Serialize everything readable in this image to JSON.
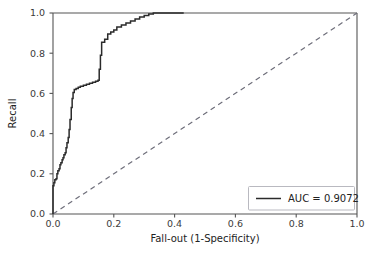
{
  "chart_data": {
    "type": "line",
    "title": "",
    "subtitle": "",
    "xlabel": "Fall-out (1-Specificity)",
    "ylabel": "Recall",
    "xlim": [
      0.0,
      1.0
    ],
    "ylim": [
      0.0,
      1.0
    ],
    "grid": false,
    "legend_position": "lower right",
    "xticks": [
      "0.0",
      "0.2",
      "0.4",
      "0.6",
      "0.8",
      "1.0"
    ],
    "xtick_values": [
      0.0,
      0.2,
      0.4,
      0.6,
      0.8,
      1.0
    ],
    "yticks": [
      "0.0",
      "0.2",
      "0.4",
      "0.6",
      "0.8",
      "1.0"
    ],
    "ytick_values": [
      0.0,
      0.2,
      0.4,
      0.6,
      0.8,
      1.0
    ],
    "annotations": [],
    "series": [
      {
        "name": "AUC = 0.9072",
        "style": "solid",
        "color": "#2b2b2b",
        "x": [
          0.0,
          0.0,
          0.003,
          0.003,
          0.006,
          0.006,
          0.01,
          0.01,
          0.013,
          0.013,
          0.016,
          0.016,
          0.02,
          0.02,
          0.023,
          0.023,
          0.026,
          0.026,
          0.03,
          0.03,
          0.033,
          0.033,
          0.036,
          0.036,
          0.04,
          0.04,
          0.043,
          0.043,
          0.046,
          0.046,
          0.05,
          0.05,
          0.053,
          0.053,
          0.056,
          0.056,
          0.06,
          0.06,
          0.063,
          0.063,
          0.066,
          0.066,
          0.07,
          0.07,
          0.076,
          0.076,
          0.083,
          0.083,
          0.09,
          0.09,
          0.1,
          0.1,
          0.11,
          0.11,
          0.12,
          0.12,
          0.13,
          0.13,
          0.14,
          0.14,
          0.148,
          0.148,
          0.152,
          0.152,
          0.156,
          0.156,
          0.16,
          0.16,
          0.17,
          0.17,
          0.18,
          0.18,
          0.19,
          0.19,
          0.2,
          0.2,
          0.21,
          0.21,
          0.225,
          0.225,
          0.24,
          0.24,
          0.255,
          0.255,
          0.27,
          0.27,
          0.285,
          0.285,
          0.3,
          0.3,
          0.315,
          0.315,
          0.33,
          0.33,
          0.43
        ],
        "y": [
          0.0,
          0.14,
          0.14,
          0.155,
          0.155,
          0.17,
          0.17,
          0.175,
          0.175,
          0.2,
          0.2,
          0.215,
          0.215,
          0.225,
          0.225,
          0.245,
          0.245,
          0.255,
          0.255,
          0.27,
          0.27,
          0.28,
          0.28,
          0.295,
          0.295,
          0.305,
          0.305,
          0.33,
          0.33,
          0.355,
          0.355,
          0.38,
          0.38,
          0.42,
          0.42,
          0.47,
          0.47,
          0.53,
          0.53,
          0.575,
          0.575,
          0.605,
          0.605,
          0.62,
          0.62,
          0.625,
          0.625,
          0.63,
          0.63,
          0.635,
          0.635,
          0.64,
          0.64,
          0.645,
          0.645,
          0.65,
          0.65,
          0.655,
          0.655,
          0.66,
          0.66,
          0.665,
          0.665,
          0.72,
          0.72,
          0.79,
          0.79,
          0.855,
          0.855,
          0.87,
          0.87,
          0.895,
          0.895,
          0.905,
          0.905,
          0.915,
          0.915,
          0.93,
          0.93,
          0.94,
          0.94,
          0.95,
          0.95,
          0.96,
          0.96,
          0.97,
          0.97,
          0.98,
          0.98,
          0.988,
          0.988,
          0.995,
          0.995,
          1.0,
          1.0
        ]
      },
      {
        "name": "chance-diagonal",
        "style": "dashed",
        "color": "#6e6e7a",
        "x": [
          0.0,
          1.0
        ],
        "y": [
          0.0,
          1.0
        ]
      }
    ],
    "legend": [
      {
        "label": "AUC = 0.9072",
        "color": "#2b2b2b",
        "style": "solid"
      }
    ],
    "auc_value": "0.9072"
  },
  "axes": {
    "xlabel": "Fall-out (1-Specificity)",
    "ylabel": "Recall",
    "xtick_labels": [
      "0.0",
      "0.2",
      "0.4",
      "0.6",
      "0.8",
      "1.0"
    ],
    "ytick_labels": [
      "0.0",
      "0.2",
      "0.4",
      "0.6",
      "0.8",
      "1.0"
    ]
  },
  "legend": {
    "auc_label": "AUC = 0.9072"
  },
  "colors": {
    "curve": "#2b2b2b",
    "diagonal": "#6e6e7a",
    "spine": "#555555",
    "text": "#222222",
    "legend_border": "#b9b9c0",
    "background": "#ffffff"
  }
}
